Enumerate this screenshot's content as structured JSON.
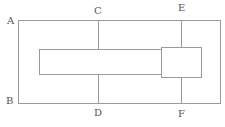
{
  "diagram": {
    "labels": {
      "a": "A",
      "b": "B",
      "c": "C",
      "d": "D",
      "e": "E",
      "f": "F"
    },
    "colors": {
      "stroke": "#9a9a9a",
      "label": "#555555",
      "background": "#ffffff"
    }
  }
}
